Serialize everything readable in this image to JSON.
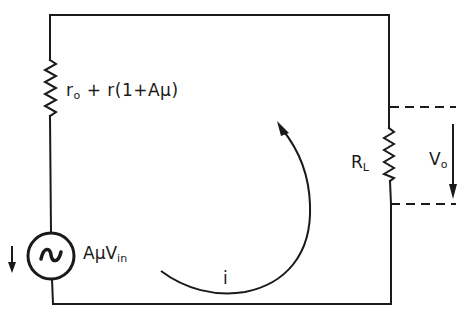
{
  "diagram": {
    "type": "circuit-schematic",
    "stroke_color": "#1a1a1a",
    "background": "#ffffff",
    "components": {
      "series_resistor": {
        "label_main": "r",
        "label_sub": "o",
        "label_rest": " + r(1+Aμ)"
      },
      "voltage_source": {
        "symbol": "~",
        "label_main": "AμV",
        "label_sub": "in",
        "direction_arrow": "down"
      },
      "load_resistor": {
        "label_main": "R",
        "label_sub": "L"
      },
      "output_voltage": {
        "label_main": "V",
        "label_sub": "o",
        "direction_arrow": "down"
      },
      "loop_current": {
        "label": "i",
        "direction": "counterclockwise"
      }
    }
  }
}
